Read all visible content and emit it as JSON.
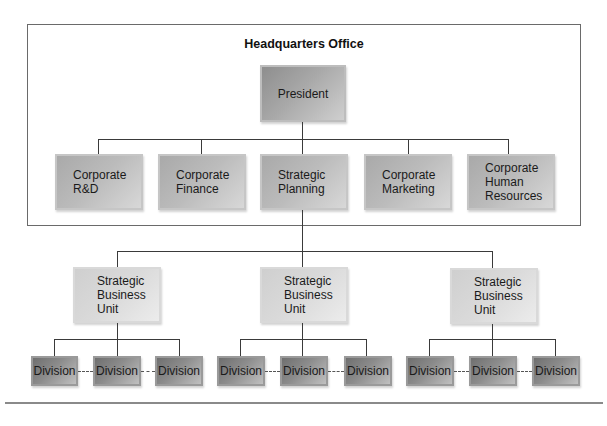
{
  "diagram": {
    "type": "org-chart",
    "headquarters": {
      "title": "Headquarters Office",
      "president": "President",
      "staff_units": [
        {
          "label": "Corporate R&D",
          "lines": [
            "Corporate",
            "R&D"
          ]
        },
        {
          "label": "Corporate Finance",
          "lines": [
            "Corporate",
            "Finance"
          ]
        },
        {
          "label": "Strategic Planning",
          "lines": [
            "Strategic",
            "Planning"
          ]
        },
        {
          "label": "Corporate Marketing",
          "lines": [
            "Corporate",
            "Marketing"
          ]
        },
        {
          "label": "Corporate Human Resources",
          "lines": [
            "Corporate",
            "Human",
            "Resources"
          ]
        }
      ]
    },
    "business_units": [
      {
        "lines": [
          "Strategic",
          "Business",
          "Unit"
        ],
        "divisions": [
          "Division",
          "Division",
          "Division"
        ]
      },
      {
        "lines": [
          "Strategic",
          "Business",
          "Unit"
        ],
        "divisions": [
          "Division",
          "Division",
          "Division"
        ]
      },
      {
        "lines": [
          "Strategic",
          "Business",
          "Unit"
        ],
        "divisions": [
          "Division",
          "Division",
          "Division"
        ]
      }
    ]
  },
  "colors": {
    "frame": "#6a6a6a",
    "connector": "#3a3a3a",
    "president_box": "#a8a8a8",
    "staff_box": "#bcbcbc",
    "sbu_box": "#dadada",
    "division_box": "#8c8c8c"
  }
}
